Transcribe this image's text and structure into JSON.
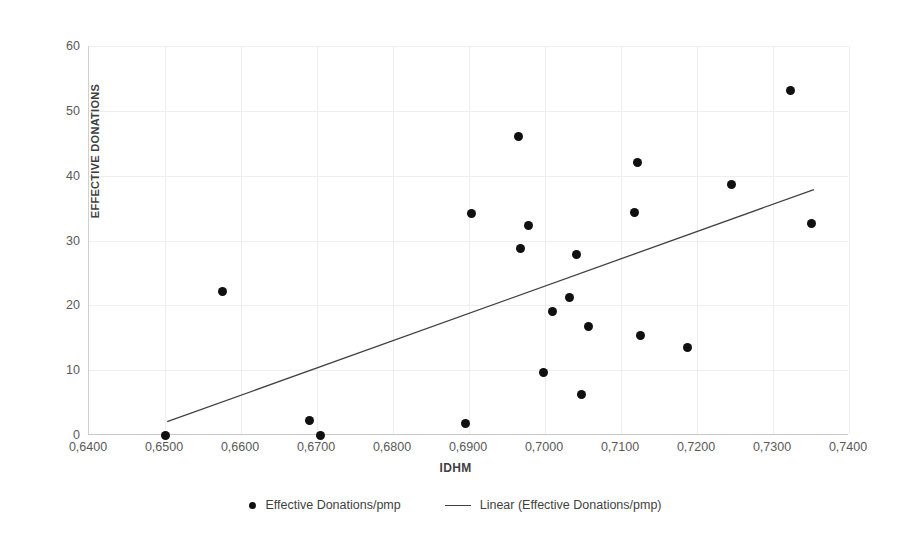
{
  "chart_data": {
    "type": "scatter",
    "title": "",
    "xlabel": "IDHM",
    "ylabel": "EFFECTIVE DONATIONS",
    "xlim": [
      0.64,
      0.74
    ],
    "ylim": [
      0,
      60
    ],
    "grid": true,
    "legend_position": "bottom",
    "x_ticks": [
      "0,6400",
      "0,6500",
      "0,6600",
      "0,6700",
      "0,6800",
      "0,6900",
      "0,7000",
      "0,7100",
      "0,7200",
      "0,7300",
      "0,7400"
    ],
    "x_tick_values": [
      0.64,
      0.65,
      0.66,
      0.67,
      0.68,
      0.69,
      0.7,
      0.71,
      0.72,
      0.73,
      0.74
    ],
    "y_ticks": [
      "0",
      "10",
      "20",
      "30",
      "40",
      "50",
      "60"
    ],
    "y_tick_values": [
      0,
      10,
      20,
      30,
      40,
      50,
      60
    ],
    "series": [
      {
        "name": "Effective Donations/pmp",
        "type": "scatter",
        "marker": "circle",
        "color": "#101010",
        "points": [
          {
            "x": 0.65,
            "y": 0.0
          },
          {
            "x": 0.6575,
            "y": 22.2
          },
          {
            "x": 0.669,
            "y": 2.3
          },
          {
            "x": 0.6705,
            "y": 0.0
          },
          {
            "x": 0.6895,
            "y": 1.8
          },
          {
            "x": 0.6903,
            "y": 34.2
          },
          {
            "x": 0.6965,
            "y": 46.0
          },
          {
            "x": 0.6968,
            "y": 28.7
          },
          {
            "x": 0.6978,
            "y": 32.3
          },
          {
            "x": 0.6998,
            "y": 9.7
          },
          {
            "x": 0.701,
            "y": 19.0
          },
          {
            "x": 0.7032,
            "y": 21.2
          },
          {
            "x": 0.7042,
            "y": 27.8
          },
          {
            "x": 0.7048,
            "y": 6.2
          },
          {
            "x": 0.7057,
            "y": 16.7
          },
          {
            "x": 0.7118,
            "y": 34.3
          },
          {
            "x": 0.7122,
            "y": 42.0
          },
          {
            "x": 0.7125,
            "y": 15.4
          },
          {
            "x": 0.7188,
            "y": 13.5
          },
          {
            "x": 0.7245,
            "y": 38.7
          },
          {
            "x": 0.7323,
            "y": 53.2
          },
          {
            "x": 0.735,
            "y": 32.6
          }
        ]
      },
      {
        "name": "Linear (Effective Donations/pmp)",
        "type": "line",
        "color": "#404040",
        "trendline": true,
        "x_start": 0.6503,
        "y_start": 1.9,
        "x_end": 0.7355,
        "y_end": 37.8
      }
    ]
  },
  "axes": {
    "y_title": "EFFECTIVE DONATIONS",
    "x_title": "IDHM"
  },
  "legend": {
    "entries": [
      {
        "label": "Effective Donations/pmp",
        "marker": "circle"
      },
      {
        "label": "Linear (Effective Donations/pmp)",
        "marker": "line"
      }
    ]
  }
}
